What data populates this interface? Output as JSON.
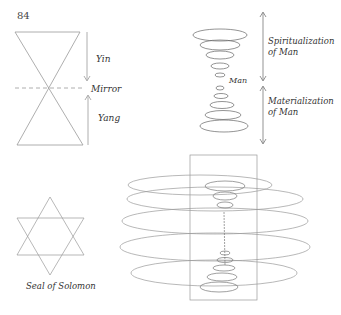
{
  "page_number": "84",
  "figures": {
    "hourglass": {
      "labels": {
        "top": "Yin",
        "middle": "Mirror",
        "bottom": "Yang"
      }
    },
    "spiral": {
      "center_label": "Man",
      "upper_label_1": "Spiritualization",
      "upper_label_2": "of Man",
      "lower_label_1": "Materialization",
      "lower_label_2": "of Man"
    },
    "star": {
      "caption": "Seal of Solomon"
    },
    "large_spiral": {}
  }
}
